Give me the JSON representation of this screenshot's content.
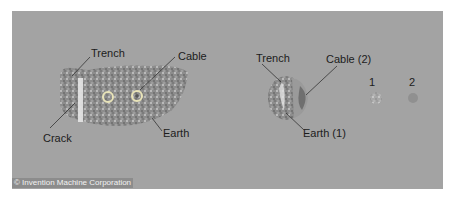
{
  "left_figure": {
    "labels": {
      "trench": "Trench",
      "cable": "Cable",
      "crack": "Crack",
      "earth": "Earth"
    }
  },
  "right_figure": {
    "labels": {
      "trench": "Trench",
      "cable": "Cable (2)",
      "earth": "Earth (1)",
      "item1": "1",
      "item2": "2"
    }
  },
  "credit": "© Invention Machine Corporation",
  "colors": {
    "background": "#a3a3a3",
    "earth": "#8a8a8a",
    "text": "#1c1c1c"
  }
}
